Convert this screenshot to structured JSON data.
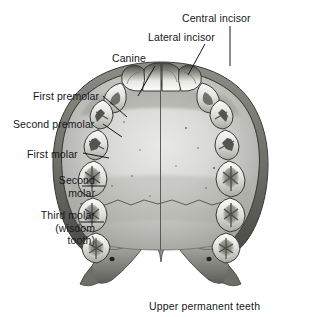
{
  "figure": {
    "title_caption": "Upper permanent teeth",
    "background_color": "#ffffff",
    "ink_color": "#16181a"
  },
  "labels": [
    {
      "id": "central-incisor",
      "text": "Central incisor",
      "x": 182,
      "y": 12,
      "align": "left"
    },
    {
      "id": "lateral-incisor",
      "text": "Lateral incisor",
      "x": 148,
      "y": 31,
      "align": "left"
    },
    {
      "id": "canine",
      "text": "Canine",
      "x": 112,
      "y": 52,
      "align": "left"
    },
    {
      "id": "first-premolar",
      "text": "First premolar",
      "x": 33,
      "y": 90,
      "align": "left"
    },
    {
      "id": "second-premolar",
      "text": "Second premolar",
      "x": 13,
      "y": 118,
      "align": "left"
    },
    {
      "id": "first-molar",
      "text": "First molar",
      "x": 27,
      "y": 148,
      "align": "left"
    },
    {
      "id": "second-molar",
      "text": "Second\nmolar",
      "x": 22,
      "y": 174,
      "align": "right"
    },
    {
      "id": "third-molar",
      "text": "Third molar\n(wisdom\ntooth)",
      "x": 8,
      "y": 209,
      "align": "right"
    }
  ],
  "leader_lines": [
    {
      "id": "leader-central-incisor",
      "x1": 230,
      "y1": 26,
      "x2": 230,
      "y2": 66
    },
    {
      "id": "leader-lateral-incisor",
      "x1": 205,
      "y1": 44,
      "x2": 188,
      "y2": 75
    },
    {
      "id": "leader-canine",
      "x1": 155,
      "y1": 66,
      "x2": 138,
      "y2": 96
    },
    {
      "id": "leader-first-premolar",
      "x1": 103,
      "y1": 96,
      "x2": 127,
      "y2": 117
    },
    {
      "id": "leader-second-premolar",
      "x1": 103,
      "y1": 124,
      "x2": 122,
      "y2": 137
    },
    {
      "id": "leader-first-molar",
      "x1": 83,
      "y1": 153,
      "x2": 109,
      "y2": 158
    },
    {
      "id": "leader-second-molar",
      "x1": 82,
      "y1": 186,
      "x2": 105,
      "y2": 186
    },
    {
      "id": "leader-third-molar",
      "x1": 80,
      "y1": 222,
      "x2": 104,
      "y2": 222
    }
  ],
  "caption": {
    "text": "Upper permanent teeth",
    "x": 149,
    "y": 300
  },
  "teeth": {
    "count_total": 16,
    "per_quadrant": 8,
    "quadrant_order": [
      "central incisor",
      "lateral incisor",
      "canine",
      "first premolar",
      "second premolar",
      "first molar",
      "second molar",
      "third molar (wisdom tooth)"
    ]
  },
  "palate_features": [
    "median palatine suture",
    "transverse palatine suture",
    "incisive papilla",
    "greater palatine foramen",
    "pterygoid hamulus"
  ]
}
